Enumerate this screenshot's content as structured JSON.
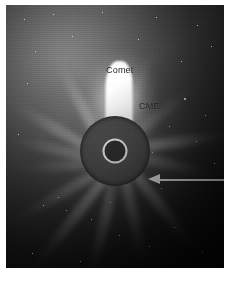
{
  "image": {
    "kind": "coronagraph-image",
    "description": "SOHO LASCO coronagraph frame showing a bright comet and a coronal mass ejection above the occulting disk",
    "frame": {
      "x": 6,
      "y": 5,
      "width": 218,
      "height": 263
    },
    "background_color": "#050506"
  },
  "annotations": {
    "comet_label": "Comet",
    "cme_label": "CME"
  },
  "markers": {
    "occulting_disk": {
      "label": "occulting-disk",
      "color": "#4b4b4b",
      "diameter": 70
    },
    "sun_marker": {
      "label": "sun-size-circle",
      "color": "#f2f2f2",
      "diameter": 21
    },
    "pointer_arrow": {
      "label": "pointer-arrow",
      "color": "#f0f0f0",
      "direction": "left"
    }
  },
  "features": {
    "streamers": [
      {
        "angle": -118,
        "length": 132,
        "opacity": 0.85
      },
      {
        "angle": -150,
        "length": 124,
        "opacity": 0.75
      },
      {
        "angle": -168,
        "length": 110,
        "opacity": 0.6
      },
      {
        "angle": -68,
        "length": 118,
        "opacity": 0.55
      },
      {
        "angle": -38,
        "length": 108,
        "opacity": 0.5
      },
      {
        "angle": -8,
        "length": 120,
        "opacity": 0.85
      },
      {
        "angle": 14,
        "length": 104,
        "opacity": 0.55
      },
      {
        "angle": 52,
        "length": 126,
        "opacity": 0.7
      },
      {
        "angle": 78,
        "length": 118,
        "opacity": 0.6
      },
      {
        "angle": 104,
        "length": 130,
        "opacity": 0.7
      },
      {
        "angle": 128,
        "length": 138,
        "opacity": 0.8
      },
      {
        "angle": 150,
        "length": 122,
        "opacity": 0.62
      },
      {
        "angle": 176,
        "length": 104,
        "opacity": 0.45
      }
    ],
    "stars": [
      {
        "x": 18,
        "y": 14,
        "s": 1
      },
      {
        "x": 47,
        "y": 9,
        "s": 1
      },
      {
        "x": 96,
        "y": 7,
        "s": 1
      },
      {
        "x": 150,
        "y": 12,
        "s": 1
      },
      {
        "x": 191,
        "y": 20,
        "s": 1
      },
      {
        "x": 29,
        "y": 46,
        "s": 1
      },
      {
        "x": 66,
        "y": 31,
        "s": 1
      },
      {
        "x": 132,
        "y": 34,
        "s": 1
      },
      {
        "x": 175,
        "y": 56,
        "s": 1
      },
      {
        "x": 205,
        "y": 41,
        "s": 1
      },
      {
        "x": 21,
        "y": 78,
        "s": 1
      },
      {
        "x": 178,
        "y": 93,
        "s": 2
      },
      {
        "x": 199,
        "y": 110,
        "s": 1
      },
      {
        "x": 163,
        "y": 121,
        "s": 1
      },
      {
        "x": 190,
        "y": 136,
        "s": 1
      },
      {
        "x": 12,
        "y": 129,
        "s": 1
      },
      {
        "x": 208,
        "y": 158,
        "s": 1
      },
      {
        "x": 146,
        "y": 147,
        "s": 1
      },
      {
        "x": 52,
        "y": 192,
        "s": 1
      },
      {
        "x": 37,
        "y": 200,
        "s": 1
      },
      {
        "x": 60,
        "y": 205,
        "s": 1
      },
      {
        "x": 85,
        "y": 214,
        "s": 1
      },
      {
        "x": 113,
        "y": 230,
        "s": 1
      },
      {
        "x": 143,
        "y": 241,
        "s": 1
      },
      {
        "x": 168,
        "y": 222,
        "s": 1
      },
      {
        "x": 196,
        "y": 247,
        "s": 1
      },
      {
        "x": 26,
        "y": 248,
        "s": 1
      },
      {
        "x": 74,
        "y": 256,
        "s": 1
      },
      {
        "x": 104,
        "y": 197,
        "s": 1
      },
      {
        "x": 155,
        "y": 183,
        "s": 1
      }
    ]
  }
}
